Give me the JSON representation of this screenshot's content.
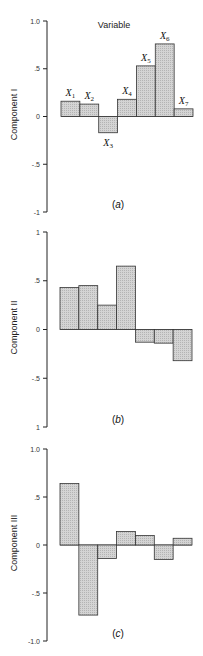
{
  "chart_data": [
    {
      "type": "bar",
      "panel_label": "(a)",
      "title": "Variable",
      "ylabel": "Component I",
      "categories": [
        "X1",
        "X2",
        "X3",
        "X4",
        "X5",
        "X6",
        "X7"
      ],
      "values": [
        0.16,
        0.13,
        -0.17,
        0.18,
        0.53,
        0.76,
        0.08
      ],
      "ytick_labels": [
        "1.0",
        ".5",
        "0",
        "-.5",
        "-1"
      ],
      "yticks": [
        1.0,
        0.5,
        0,
        -0.5,
        -1.0
      ],
      "ylim": [
        -1,
        1
      ],
      "bar_labels_visible": true,
      "grid": false
    },
    {
      "type": "bar",
      "panel_label": "(b)",
      "ylabel": "Component II",
      "categories": [
        "X1",
        "X2",
        "X3",
        "X4",
        "X5",
        "X6",
        "X7"
      ],
      "values": [
        0.43,
        0.45,
        0.25,
        0.65,
        -0.13,
        -0.14,
        -0.32
      ],
      "ytick_labels": [
        "1",
        ".5",
        "0",
        "-.5",
        "1"
      ],
      "yticks": [
        1.0,
        0.5,
        0,
        -0.5,
        -1.0
      ],
      "ylim": [
        -1,
        1
      ],
      "bar_labels_visible": false,
      "grid": false
    },
    {
      "type": "bar",
      "panel_label": "(c)",
      "ylabel": "Component III",
      "categories": [
        "X1",
        "X2",
        "X3",
        "X4",
        "X5",
        "X6",
        "X7"
      ],
      "values": [
        0.64,
        -0.73,
        -0.14,
        0.14,
        0.1,
        -0.15,
        0.07
      ],
      "ytick_labels": [
        "1.0",
        ".5",
        "0",
        "-.5",
        "-1.0"
      ],
      "yticks": [
        1.0,
        0.5,
        0,
        -0.5,
        -1.0
      ],
      "ylim": [
        -1,
        1
      ],
      "bar_labels_visible": false,
      "grid": false
    }
  ],
  "style": {
    "bar_fill": "#c9c9c9",
    "bar_stroke": "#333333",
    "axis_color": "#222222"
  }
}
